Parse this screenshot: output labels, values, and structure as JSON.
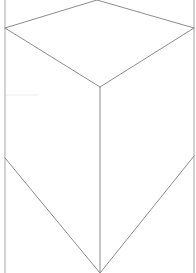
{
  "diagram": {
    "type": "isometric-prism-line-drawing",
    "colors": {
      "background": "#ffffff",
      "edge": "#8c8c8c",
      "border_edge": "#b4b4b4"
    },
    "vertices": {
      "top_apex": [
        97,
        0
      ],
      "left_upper": [
        5,
        28
      ],
      "right_upper": [
        194,
        28
      ],
      "center_front": [
        100,
        87
      ],
      "left_lower": [
        5,
        158
      ],
      "right_lower": [
        194,
        156
      ],
      "bottom_apex": [
        100,
        273
      ]
    },
    "edges": [
      {
        "name": "top-face-left-back",
        "from": "top_apex",
        "to": "left_upper"
      },
      {
        "name": "top-face-right-back",
        "from": "top_apex",
        "to": "right_upper"
      },
      {
        "name": "top-face-left-front",
        "from": "left_upper",
        "to": "center_front"
      },
      {
        "name": "top-face-right-front",
        "from": "right_upper",
        "to": "center_front"
      },
      {
        "name": "front-vertical-edge",
        "from": "center_front",
        "to": "bottom_apex"
      },
      {
        "name": "bottom-left-edge",
        "from": "left_lower",
        "to": "bottom_apex"
      },
      {
        "name": "bottom-right-edge",
        "from": "right_lower",
        "to": "bottom_apex"
      }
    ],
    "borders": {
      "left_x": 5,
      "right_x": 194
    }
  }
}
